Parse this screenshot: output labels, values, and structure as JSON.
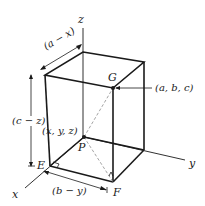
{
  "diagram": {
    "axes": {
      "x": "x",
      "y": "y",
      "z": "z"
    },
    "points": {
      "G": {
        "label": "G",
        "coord_label": "(a, b, c)"
      },
      "P": {
        "label": "P",
        "coord_label": "(x, y, z)"
      },
      "E": {
        "label": "E"
      },
      "F": {
        "label": "F"
      }
    },
    "dimensions": {
      "depth": "(a − x)",
      "height": "(c − z)",
      "width": "(b − y)"
    },
    "colors": {
      "stroke": "#1a1a1a",
      "dashed": "#9a9a9a",
      "background": "#ffffff"
    }
  }
}
